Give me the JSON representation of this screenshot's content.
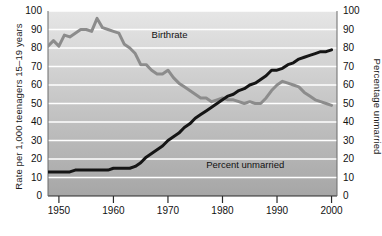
{
  "chart_data": {
    "type": "line",
    "title": "",
    "xlabel": "",
    "ylabel": "Rate per 1,000 teenagers 15–19 years",
    "ylabel_right": "Percentage unmarried",
    "xlim": [
      1948,
      2001
    ],
    "ylim": [
      0,
      100
    ],
    "ylim_right": [
      0,
      100
    ],
    "grid": true,
    "legend_position": "inline-annotation",
    "xticks": [
      1950,
      1960,
      1970,
      1980,
      1990,
      2000
    ],
    "xtick_labels": [
      "1950",
      "1960",
      "1970",
      "1980",
      "1990",
      "2000"
    ],
    "yticks": [
      0,
      10,
      20,
      30,
      40,
      50,
      60,
      70,
      80,
      90,
      100
    ],
    "ytick_labels": [
      "0",
      "10",
      "20",
      "30",
      "40",
      "50",
      "60",
      "70",
      "80",
      "90",
      "100"
    ],
    "yticks_right": [
      0,
      10,
      20,
      30,
      40,
      50,
      60,
      70,
      80,
      90,
      100
    ],
    "ytick_labels_right": [
      "0",
      "10",
      "20",
      "30",
      "40",
      "50",
      "60",
      "70",
      "80",
      "90",
      "100"
    ],
    "series": [
      {
        "name": "Birthrate",
        "color": "#8c8c8c",
        "axis": "left",
        "x": [
          1948,
          1949,
          1950,
          1951,
          1952,
          1953,
          1954,
          1955,
          1956,
          1957,
          1958,
          1959,
          1960,
          1961,
          1962,
          1963,
          1964,
          1965,
          1966,
          1967,
          1968,
          1969,
          1970,
          1971,
          1972,
          1973,
          1974,
          1975,
          1976,
          1977,
          1978,
          1979,
          1980,
          1981,
          1982,
          1983,
          1984,
          1985,
          1986,
          1987,
          1988,
          1989,
          1990,
          1991,
          1992,
          1993,
          1994,
          1995,
          1996,
          1997,
          1998,
          1999,
          2000
        ],
        "values": [
          81,
          84,
          81,
          87,
          86,
          88,
          90,
          90,
          89,
          96,
          91,
          90,
          89,
          88,
          82,
          80,
          77,
          71,
          71,
          68,
          66,
          66,
          68,
          64,
          61,
          59,
          57,
          55,
          53,
          53,
          51,
          52,
          53,
          52,
          52,
          51,
          50,
          51,
          50,
          50,
          53,
          57,
          60,
          62,
          61,
          60,
          59,
          56,
          54,
          52,
          51,
          50,
          49
        ]
      },
      {
        "name": "Percent unmarried",
        "color": "#151515",
        "axis": "right",
        "x": [
          1948,
          1949,
          1950,
          1951,
          1952,
          1953,
          1954,
          1955,
          1956,
          1957,
          1958,
          1959,
          1960,
          1961,
          1962,
          1963,
          1964,
          1965,
          1966,
          1967,
          1968,
          1969,
          1970,
          1971,
          1972,
          1973,
          1974,
          1975,
          1976,
          1977,
          1978,
          1979,
          1980,
          1981,
          1982,
          1983,
          1984,
          1985,
          1986,
          1987,
          1988,
          1989,
          1990,
          1991,
          1992,
          1993,
          1994,
          1995,
          1996,
          1997,
          1998,
          1999,
          2000
        ],
        "values": [
          13,
          13,
          13,
          13,
          13,
          14,
          14,
          14,
          14,
          14,
          14,
          14,
          15,
          15,
          15,
          15,
          16,
          18,
          21,
          23,
          25,
          27,
          30,
          32,
          34,
          37,
          39,
          42,
          44,
          46,
          48,
          50,
          52,
          54,
          55,
          57,
          58,
          60,
          61,
          63,
          65,
          68,
          68,
          69,
          71,
          72,
          74,
          75,
          76,
          77,
          78,
          78,
          79
        ]
      }
    ],
    "annotations": [
      {
        "text": "Birthrate",
        "x": 1967,
        "y": 87
      },
      {
        "text": "Percent unmarried",
        "x": 1977,
        "y": 17
      }
    ]
  },
  "plot_style": {
    "background_top": "#e3e3e3",
    "background_bottom": "#a9a9a9",
    "gridline_color": "#ffffff",
    "axis_color": "#2a2a2a"
  }
}
